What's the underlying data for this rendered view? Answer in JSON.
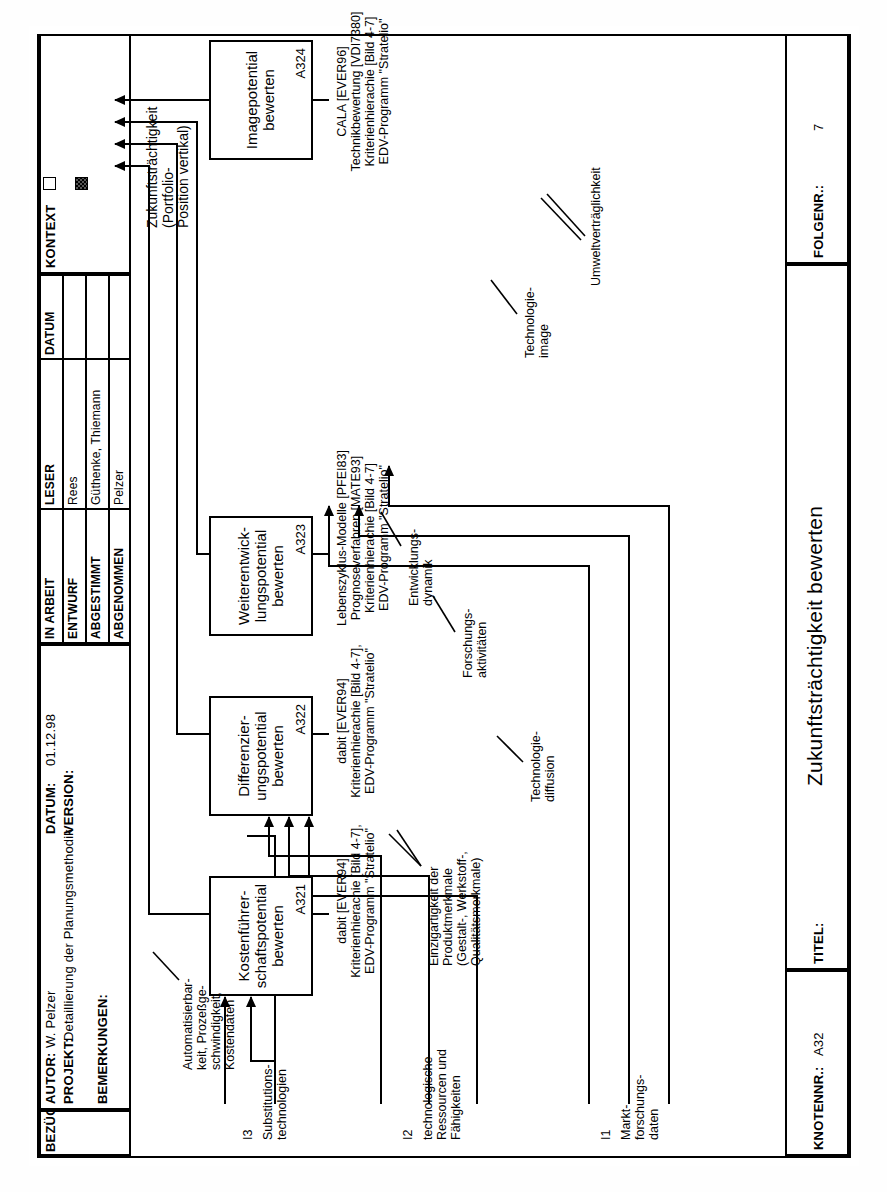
{
  "sheet": {
    "header": {
      "autor_label": "AUTOR:",
      "autor_value": "W. Pelzer",
      "projekt_label": "PROJEKT:",
      "projekt_value": "Detaillierung der Planungsmethodik",
      "datum_label": "DATUM:",
      "datum_value": "01.12.98",
      "version_label": "VERSION:",
      "version_value": "",
      "bemerkungen_label": "BEMERKUNGEN:",
      "bezuege_label": "BEZÜGE IN:",
      "status_rows": [
        {
          "status": "IN ARBEIT",
          "leser_head": "LESER",
          "datum_head": "DATUM"
        },
        {
          "status": "ENTWURF",
          "leser": "Rees",
          "datum": ""
        },
        {
          "status": "ABGESTIMMT",
          "leser": "Güthenke, Thiemann",
          "datum": ""
        },
        {
          "status": "ABGENOMMEN",
          "leser": "Pelzer",
          "datum": ""
        }
      ],
      "kontext_label": "KONTEXT",
      "kontext_marks": [
        "empty-square",
        "hatched-square"
      ]
    },
    "footer": {
      "knotennr_label": "KNOTENNR.:",
      "knotennr_value": "A32",
      "titel_label": "TITEL:",
      "titel_value": "Zukunftsträchtigkeit bewerten",
      "folgenr_label": "FOLGENR.:",
      "folgenr_value": "7"
    }
  },
  "diagram": {
    "boxes": [
      {
        "id": "A321",
        "title": "Kostenführer-\nschaftspotential\nbewerten",
        "code": "A321"
      },
      {
        "id": "A322",
        "title": "Differenzier-\nungspotential\nbewerten",
        "code": "A322"
      },
      {
        "id": "A323",
        "title": "Weiterentwick-\nlungspotential\nbewerten",
        "code": "A323"
      },
      {
        "id": "A324",
        "title": "Imagepotential\nbewerten",
        "code": "A324"
      }
    ],
    "mechanisms": [
      {
        "for": "A321",
        "text": "dabit [EVER94]\nKriterienhierachie [Bild 4-7],\nEDV-Programm \"Stratelio\""
      },
      {
        "for": "A322",
        "text": "dabit [EVER94]\nKriterienhierachie [Bild 4-7],\nEDV-Programm \"Stratelio\""
      },
      {
        "for": "A323",
        "text": "Lebenszyklus-Modelle [PFEI83]\nPrognoseverfahren [MATE93]\nKriterienhierachie [Bild 4-7]\nEDV-Programm \"Stratelio\""
      },
      {
        "for": "A324",
        "text": "CALA [EVER96]\nTechnikbewertung [VDI7380]\nKriterienhierachie [Bild 4-7]\nEDV-Programm \"Stratelio\""
      }
    ],
    "inputs": [
      {
        "code": "I3",
        "label": "Substitutions-\ntechnologien"
      },
      {
        "code": "I2",
        "label": "technologische\nRessourcen und\nFähigkeiten"
      },
      {
        "code": "I1",
        "label": "Markt-\nforschungs-\ndaten"
      }
    ],
    "output": {
      "code": "O1",
      "label": "Zukunftsträchtigkeit\n(Portfolio-\nPosition vertikal)"
    },
    "arrow_labels": [
      {
        "name": "automatisierbarkeit",
        "text": "Automatisierbar-\nkeit, Prozeßge-\nschwindigkeit,\nKostendaten"
      },
      {
        "name": "einzigartigkeit",
        "text": "Einzigartigkeit der\nProduktmerkmale\n(Gestalt-, Werkstoff-,\nQualitätsmerkmale)"
      },
      {
        "name": "technologie-diffusion",
        "text": "Technologie-\ndiffusion"
      },
      {
        "name": "forschungsaktivitaeten",
        "text": "Forschungs-\naktivitäten"
      },
      {
        "name": "entwicklungsdynamik",
        "text": "Entwicklungs-\ndynamik"
      },
      {
        "name": "technologie-image",
        "text": "Technologie-\nimage"
      },
      {
        "name": "umweltvertraeglichkeit",
        "text": "Umweltverträglichkeit"
      }
    ]
  }
}
